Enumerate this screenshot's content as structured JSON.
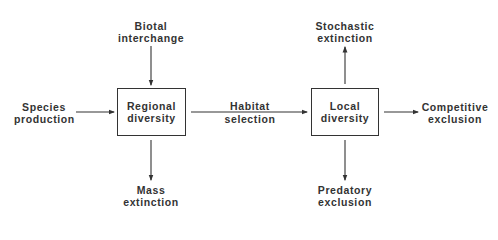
{
  "diagram": {
    "nodes": {
      "species_production": {
        "line1": "Species",
        "line2": "production"
      },
      "biotal_interchange": {
        "line1": "Biotal",
        "line2": "interchange"
      },
      "regional_diversity": {
        "line1": "Regional",
        "line2": "diversity"
      },
      "mass_extinction": {
        "line1": "Mass",
        "line2": "extinction"
      },
      "habitat_selection": {
        "line1": "Habitat",
        "line2": "selection"
      },
      "local_diversity": {
        "line1": "Local",
        "line2": "diversity"
      },
      "stochastic_extinction": {
        "line1": "Stochastic",
        "line2": "extinction"
      },
      "predatory_exclusion": {
        "line1": "Predatory",
        "line2": "exclusion"
      },
      "competitive_exclusion": {
        "line1": "Competitive",
        "line2": "exclusion"
      }
    },
    "edges": [
      {
        "from": "Species production",
        "to": "Regional diversity"
      },
      {
        "from": "Biotal interchange",
        "to": "Regional diversity"
      },
      {
        "from": "Regional diversity",
        "to": "Mass extinction"
      },
      {
        "from": "Regional diversity",
        "to": "Local diversity",
        "label": "Habitat selection"
      },
      {
        "from": "Local diversity",
        "to": "Stochastic extinction"
      },
      {
        "from": "Local diversity",
        "to": "Predatory exclusion"
      },
      {
        "from": "Local diversity",
        "to": "Competitive exclusion"
      }
    ]
  }
}
